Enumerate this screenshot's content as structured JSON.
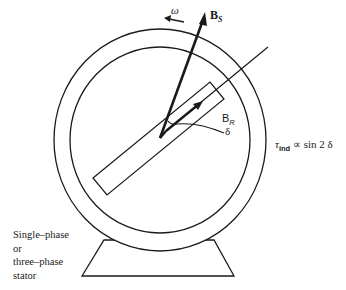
{
  "diagram": {
    "type": "synchronous-motor-schematic",
    "labels": {
      "omega": "ω",
      "stator_field": "B",
      "stator_field_sub": "S",
      "rotor_field": "B",
      "rotor_field_sub": "R",
      "angle": "δ",
      "torque_symbol": "τ",
      "torque_sub": "ind",
      "torque_relation": " ∝ sin 2 δ",
      "stator_lines": [
        "Single–phase",
        "or",
        "three–phase",
        "stator"
      ]
    },
    "colors": {
      "stroke": "#1a1a1a",
      "background": "#ffffff"
    }
  }
}
